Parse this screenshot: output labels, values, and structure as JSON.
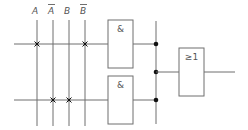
{
  "diagram": {
    "type": "PLA logic circuit",
    "inputs": [
      {
        "label": "A",
        "negated": false
      },
      {
        "label": "A",
        "negated": true
      },
      {
        "label": "B",
        "negated": false
      },
      {
        "label": "B",
        "negated": true
      }
    ],
    "and_gates": [
      {
        "symbol": "&",
        "connections": [
          "A",
          "B̄"
        ]
      },
      {
        "symbol": "&",
        "connections": [
          "Ā",
          "B"
        ]
      }
    ],
    "or_gate": {
      "symbol": "≥1"
    },
    "colors": {
      "wire": "#6f6f6f",
      "junction": "#111111",
      "background": "#ffffff"
    }
  }
}
